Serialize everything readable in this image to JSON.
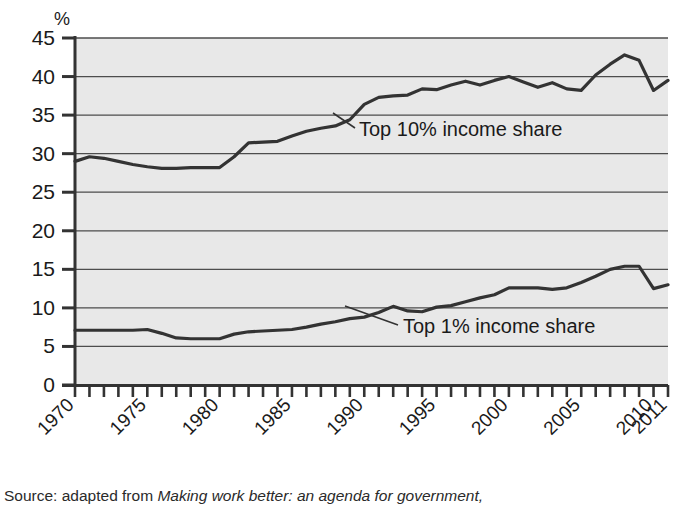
{
  "chart_data": {
    "type": "line",
    "title": "",
    "xlabel": "",
    "ylabel": "%",
    "ylim": [
      0,
      45
    ],
    "xlim": [
      1970,
      2011
    ],
    "yticks": [
      0,
      5,
      10,
      15,
      20,
      25,
      30,
      35,
      40,
      45
    ],
    "ytick_labels": [
      "0",
      "5",
      "10",
      "15",
      "20",
      "25",
      "30",
      "35",
      "40",
      "45"
    ],
    "xticks": [
      1970,
      1975,
      1980,
      1985,
      1990,
      1995,
      2000,
      2005,
      2010,
      2011
    ],
    "xtick_labels": [
      "1970",
      "1975",
      "1980",
      "1985",
      "1990",
      "1995",
      "2000",
      "2005",
      "2010",
      "2011"
    ],
    "grid": "horizontal",
    "legend_position": "inline-annotation",
    "x": [
      1970,
      1971,
      1972,
      1973,
      1974,
      1975,
      1976,
      1977,
      1978,
      1979,
      1980,
      1981,
      1982,
      1983,
      1984,
      1985,
      1986,
      1987,
      1988,
      1989,
      1990,
      1991,
      1992,
      1993,
      1994,
      1995,
      1996,
      1997,
      1998,
      1999,
      2000,
      2001,
      2002,
      2003,
      2004,
      2005,
      2006,
      2007,
      2008,
      2009,
      2010,
      2011
    ],
    "series": [
      {
        "name": "Top 10% income share",
        "color": "#333333",
        "values": [
          29.0,
          29.6,
          29.4,
          29.0,
          28.6,
          28.3,
          28.1,
          28.1,
          28.2,
          28.2,
          28.2,
          29.6,
          31.4,
          31.5,
          31.6,
          32.3,
          32.9,
          33.3,
          33.6,
          34.4,
          36.4,
          37.3,
          37.5,
          37.6,
          38.4,
          38.3,
          38.9,
          39.4,
          38.9,
          39.5,
          40.0,
          39.3,
          38.6,
          39.2,
          38.4,
          38.2,
          40.2,
          41.6,
          42.8,
          42.1,
          38.2,
          39.5
        ]
      },
      {
        "name": "Top 1% income share",
        "color": "#333333",
        "values": [
          7.1,
          7.1,
          7.1,
          7.1,
          7.1,
          7.2,
          6.7,
          6.1,
          6.0,
          6.0,
          6.0,
          6.6,
          6.9,
          7.0,
          7.1,
          7.2,
          7.5,
          7.9,
          8.2,
          8.6,
          8.8,
          9.4,
          10.2,
          9.6,
          9.5,
          10.1,
          10.3,
          10.8,
          11.3,
          11.7,
          12.6,
          12.6,
          12.6,
          12.4,
          12.6,
          13.3,
          14.1,
          15.0,
          15.4,
          15.4,
          12.5,
          13.0
        ]
      }
    ],
    "annotations": [
      {
        "name": "top10-annotation",
        "text": "Top 10% income share"
      },
      {
        "name": "top1-annotation",
        "text": "Top 1% income share"
      }
    ]
  },
  "source": {
    "prefix": "Source: adapted from ",
    "italic_title": "Making work better: an agenda for government,"
  }
}
